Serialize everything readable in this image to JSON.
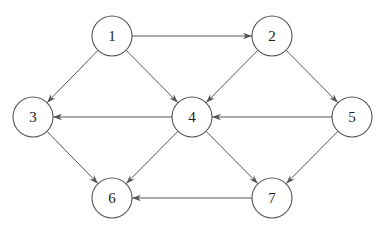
{
  "diagram": {
    "type": "directed-graph",
    "node_radius": 20,
    "nodes": [
      {
        "id": "1",
        "label": "1",
        "x": 112,
        "y": 36
      },
      {
        "id": "2",
        "label": "2",
        "x": 272,
        "y": 36
      },
      {
        "id": "3",
        "label": "3",
        "x": 33,
        "y": 117
      },
      {
        "id": "4",
        "label": "4",
        "x": 192,
        "y": 117
      },
      {
        "id": "5",
        "label": "5",
        "x": 352,
        "y": 117
      },
      {
        "id": "6",
        "label": "6",
        "x": 112,
        "y": 198
      },
      {
        "id": "7",
        "label": "7",
        "x": 272,
        "y": 198
      }
    ],
    "edges": [
      {
        "from": "1",
        "to": "2"
      },
      {
        "from": "1",
        "to": "3"
      },
      {
        "from": "1",
        "to": "4"
      },
      {
        "from": "2",
        "to": "4"
      },
      {
        "from": "2",
        "to": "5"
      },
      {
        "from": "4",
        "to": "3"
      },
      {
        "from": "5",
        "to": "4"
      },
      {
        "from": "3",
        "to": "6"
      },
      {
        "from": "4",
        "to": "6"
      },
      {
        "from": "4",
        "to": "7"
      },
      {
        "from": "5",
        "to": "7"
      },
      {
        "from": "7",
        "to": "6"
      }
    ],
    "colors": {
      "stroke": "#555555",
      "text": "#222222",
      "background": "#ffffff"
    }
  }
}
